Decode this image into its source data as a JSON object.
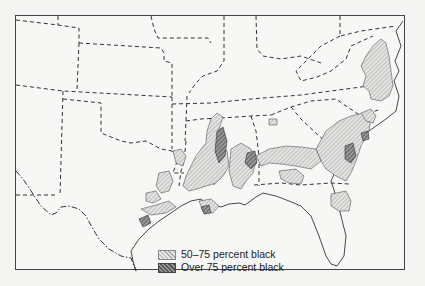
{
  "map": {
    "title": "",
    "region": "Southeastern United States",
    "legend": {
      "items": [
        {
          "label": "50–75 percent black",
          "pattern": "light-hatch",
          "color": "#b0b0b0"
        },
        {
          "label": "Over 75 percent black",
          "pattern": "dark-hatch",
          "color": "#666666"
        }
      ]
    },
    "colors": {
      "background": "#f7f7f5",
      "border": "#444444",
      "light_hatch": "#aaaaaa",
      "dark_hatch": "#555555"
    }
  }
}
